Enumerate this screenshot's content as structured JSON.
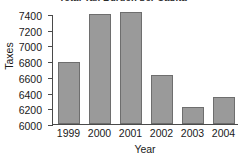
{
  "chart_data": {
    "type": "bar",
    "title": "Total Tax Burden per Capita",
    "xlabel": "Year",
    "ylabel": "Taxes",
    "categories": [
      "1999",
      "2000",
      "2001",
      "2002",
      "2003",
      "2004"
    ],
    "values": [
      6790,
      7400,
      7430,
      6620,
      6220,
      6350
    ],
    "series": [
      {
        "name": "Taxes",
        "values": [
          6790,
          7400,
          7430,
          6620,
          6220,
          6350
        ]
      }
    ],
    "ylim": [
      6000,
      7400
    ],
    "ytick_labels": [
      "6000",
      "6200",
      "6400",
      "6600",
      "6800",
      "7000",
      "7200",
      "7400"
    ],
    "ytick_values": [
      6000,
      6200,
      6400,
      6600,
      6800,
      7000,
      7200,
      7400
    ],
    "grid": false,
    "legend": "none",
    "bar_color": "#9a9a9a",
    "bar_border_color": "#6e6e6e",
    "axis_color": "#4a4a4a",
    "background": "#ffffff"
  }
}
